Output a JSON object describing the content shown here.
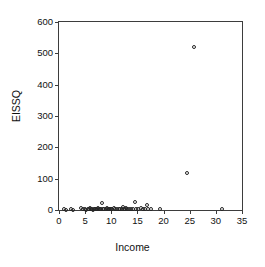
{
  "chart_data": {
    "type": "scatter",
    "title": "",
    "xlabel": "Income",
    "ylabel": "EISSQ",
    "xlim": [
      0,
      35
    ],
    "ylim": [
      0,
      600
    ],
    "xticks": [
      0,
      5,
      10,
      15,
      20,
      25,
      30,
      35
    ],
    "yticks": [
      0,
      100,
      200,
      300,
      400,
      500,
      600
    ],
    "xtick_labels": [
      "0",
      "5",
      "10",
      "15",
      "20",
      "25",
      "30",
      "35"
    ],
    "ytick_labels": [
      "0",
      "100",
      "200",
      "300",
      "400",
      "500",
      "600"
    ],
    "grid": false,
    "legend": null,
    "marker": "open-circle",
    "marker_color": "#262626",
    "frame_color": "#3d3d3d",
    "background_color": "#ffffff",
    "series": [
      {
        "name": "observations",
        "points": [
          [
            0.9,
            2
          ],
          [
            1.4,
            1
          ],
          [
            2.2,
            2
          ],
          [
            2.6,
            1
          ],
          [
            4.3,
            6
          ],
          [
            4.6,
            2
          ],
          [
            5.0,
            3
          ],
          [
            5.2,
            1
          ],
          [
            5.5,
            4
          ],
          [
            5.7,
            2
          ],
          [
            5.9,
            5
          ],
          [
            6.1,
            2
          ],
          [
            6.3,
            3
          ],
          [
            6.5,
            1
          ],
          [
            6.7,
            4
          ],
          [
            6.9,
            2
          ],
          [
            7.1,
            3
          ],
          [
            7.3,
            2
          ],
          [
            7.5,
            5
          ],
          [
            7.7,
            2
          ],
          [
            7.9,
            3
          ],
          [
            8.1,
            2
          ],
          [
            8.3,
            22
          ],
          [
            8.5,
            4
          ],
          [
            8.7,
            2
          ],
          [
            8.9,
            3
          ],
          [
            9.1,
            6
          ],
          [
            9.3,
            2
          ],
          [
            9.5,
            4
          ],
          [
            9.7,
            2
          ],
          [
            9.9,
            3
          ],
          [
            10.2,
            2
          ],
          [
            10.5,
            5
          ],
          [
            10.8,
            2
          ],
          [
            11.1,
            3
          ],
          [
            11.4,
            2
          ],
          [
            11.7,
            4
          ],
          [
            12.0,
            2
          ],
          [
            12.2,
            8
          ],
          [
            12.4,
            3
          ],
          [
            12.6,
            2
          ],
          [
            12.8,
            6
          ],
          [
            13.0,
            2
          ],
          [
            13.3,
            3
          ],
          [
            13.7,
            2
          ],
          [
            14.2,
            4
          ],
          [
            14.5,
            27
          ],
          [
            14.8,
            3
          ],
          [
            15.2,
            2
          ],
          [
            15.6,
            5
          ],
          [
            16.0,
            3
          ],
          [
            16.4,
            2
          ],
          [
            16.9,
            16
          ],
          [
            17.1,
            3
          ],
          [
            17.5,
            2
          ],
          [
            19.3,
            2
          ],
          [
            24.5,
            118
          ],
          [
            25.9,
            520
          ],
          [
            31.1,
            3
          ]
        ]
      }
    ]
  },
  "figure": {
    "width": 265,
    "height": 267
  }
}
